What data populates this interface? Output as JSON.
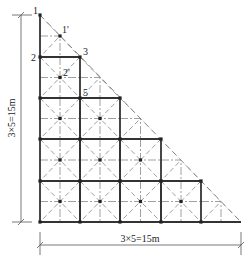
{
  "diagram": {
    "type": "staircase triangular grid structure plan",
    "grid": {
      "x": [
        40,
        80,
        120,
        161,
        201,
        241
      ],
      "y": [
        15,
        57,
        98,
        139,
        181,
        222
      ]
    },
    "node_labels": [
      {
        "id": "1",
        "text": "1",
        "x": 33,
        "y": 14
      },
      {
        "id": "1p",
        "text": "1'",
        "x": 62,
        "y": 33
      },
      {
        "id": "2",
        "text": "2",
        "x": 31,
        "y": 61
      },
      {
        "id": "3",
        "text": "3",
        "x": 83,
        "y": 55
      },
      {
        "id": "2p",
        "text": "2'",
        "x": 63,
        "y": 76
      },
      {
        "id": "5",
        "text": "5",
        "x": 83,
        "y": 96
      }
    ],
    "dimensions": {
      "vertical": {
        "text": "3×5=15m",
        "x": 21,
        "y1": 15,
        "y2": 222
      },
      "horizontal": {
        "text": "3×5=15m",
        "y": 245,
        "x1": 40,
        "x2": 241
      }
    },
    "colors": {
      "line": "#333333",
      "dashed": "#777777",
      "dimension": "#555555"
    }
  }
}
